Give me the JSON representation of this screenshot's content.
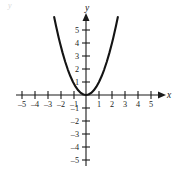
{
  "figure": {
    "name": "cartesian-parabola-graph",
    "background_color": "#ffffff",
    "ink_color": "#141414",
    "corner_mark": "y"
  },
  "axes": {
    "x_axis_label": "x",
    "y_axis_label": "y",
    "x_ticks": [
      -5,
      -4,
      -3,
      -2,
      -1,
      1,
      2,
      3,
      4,
      5
    ],
    "y_ticks": [
      -5,
      -4,
      -3,
      -2,
      -1,
      1,
      2,
      3,
      4,
      5
    ],
    "x_tick_labels": [
      "–5",
      "–4",
      "–3",
      "–2",
      "–1",
      "1",
      "2",
      "3",
      "4",
      "5"
    ],
    "y_tick_labels": [
      "–5",
      "–4",
      "–3",
      "–2",
      "–1",
      "1",
      "2",
      "3",
      "4",
      "5"
    ],
    "origin_label": "",
    "x_arrow": "right-arrow-icon",
    "y_arrow": "up-arrow-icon"
  },
  "chart_data": {
    "type": "line",
    "title": "",
    "subtitle": "",
    "xlabel": "x",
    "ylabel": "y",
    "xlim": [
      -5.8,
      5.8
    ],
    "ylim": [
      -5.8,
      6.2
    ],
    "grid": false,
    "legend": null,
    "xticks": [
      -5,
      -4,
      -3,
      -2,
      -1,
      1,
      2,
      3,
      4,
      5
    ],
    "yticks": [
      -5,
      -4,
      -3,
      -2,
      -1,
      1,
      2,
      3,
      4,
      5
    ],
    "series": [
      {
        "name": "y = x^2",
        "equation": "y = x^2",
        "x": [
          -2.45,
          -2.3,
          -2.1,
          -2.0,
          -1.8,
          -1.6,
          -1.4,
          -1.2,
          -1.0,
          -0.8,
          -0.6,
          -0.4,
          -0.2,
          0.0,
          0.2,
          0.4,
          0.6,
          0.8,
          1.0,
          1.2,
          1.4,
          1.6,
          1.8,
          2.0,
          2.1,
          2.3,
          2.45
        ],
        "y": [
          6.0,
          5.29,
          4.41,
          4.0,
          3.24,
          2.56,
          1.96,
          1.44,
          1.0,
          0.64,
          0.36,
          0.16,
          0.04,
          0.0,
          0.04,
          0.16,
          0.36,
          0.64,
          1.0,
          1.44,
          1.96,
          2.56,
          3.24,
          4.0,
          4.41,
          5.29,
          6.0
        ],
        "vertex": [
          0,
          0
        ],
        "key_points": [
          [
            -2,
            4
          ],
          [
            -1,
            1
          ],
          [
            0,
            0
          ],
          [
            1,
            1
          ],
          [
            2,
            4
          ]
        ]
      }
    ]
  }
}
